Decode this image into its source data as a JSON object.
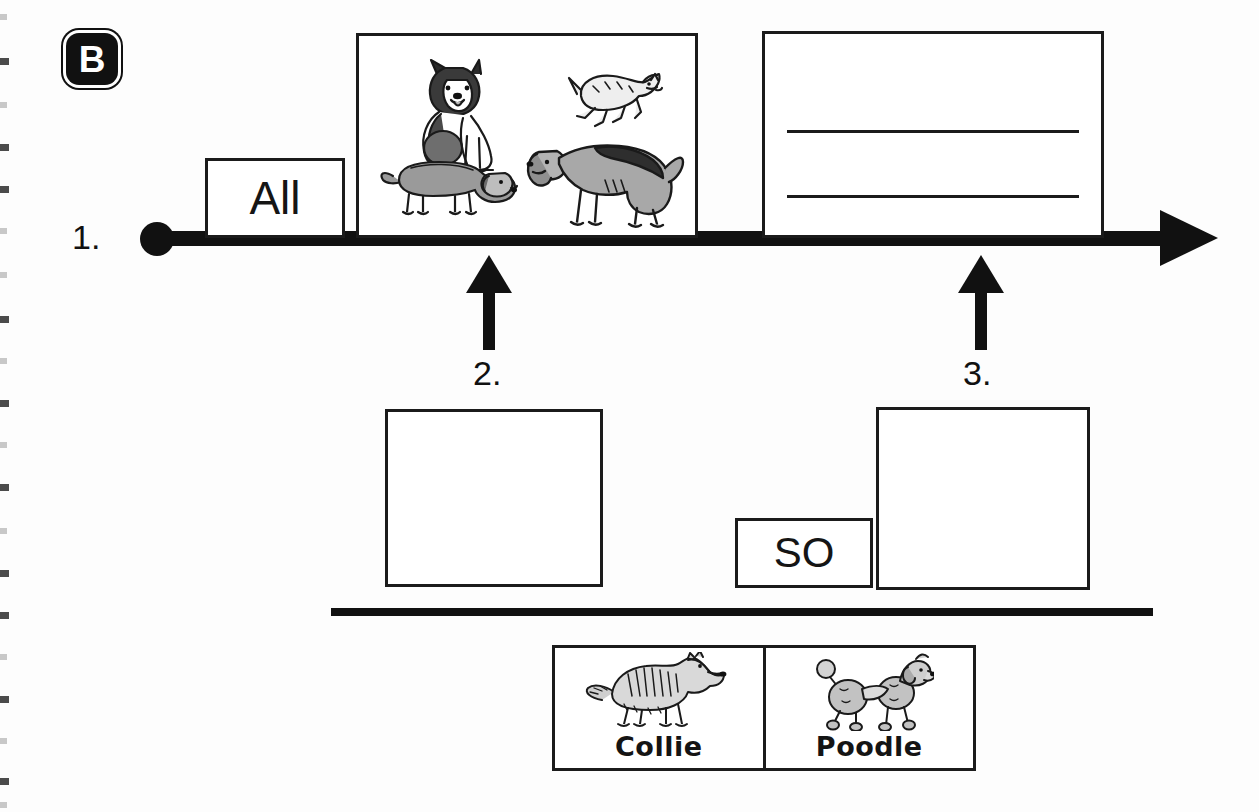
{
  "page": {
    "section_badge": "B",
    "background_color": "#fdfdfd",
    "ink_color": "#111111"
  },
  "timeline": {
    "step_label": "1.",
    "has_start_dot": true,
    "has_arrowhead": true,
    "direction": "left-to-right"
  },
  "timeline_items": [
    {
      "name": "word-box-all",
      "text": "All",
      "type": "word-card"
    },
    {
      "name": "picture-box-dogs",
      "text": "",
      "type": "picture-card",
      "images": [
        "husky-dog",
        "terrier-dog",
        "dachshund-dog",
        "hound-dog"
      ]
    },
    {
      "name": "lined-answer-box",
      "text": "",
      "type": "writing-lines",
      "line_count": 2
    }
  ],
  "callouts": [
    {
      "label": "2.",
      "points_to": "picture-box-dogs"
    },
    {
      "label": "3.",
      "points_to": "lined-answer-box"
    }
  ],
  "lower_boxes": [
    {
      "name": "blank-box-left",
      "text": "",
      "type": "empty-box"
    },
    {
      "name": "word-box-so",
      "text": "SO",
      "type": "word-card"
    },
    {
      "name": "blank-box-right",
      "text": "",
      "type": "empty-box"
    }
  ],
  "breed_cards": {
    "items": [
      {
        "label": "Collie",
        "image": "collie-dog"
      },
      {
        "label": "Poodle",
        "image": "poodle-dog"
      }
    ]
  },
  "binding_marks": {
    "count": 20,
    "edge": "left"
  }
}
